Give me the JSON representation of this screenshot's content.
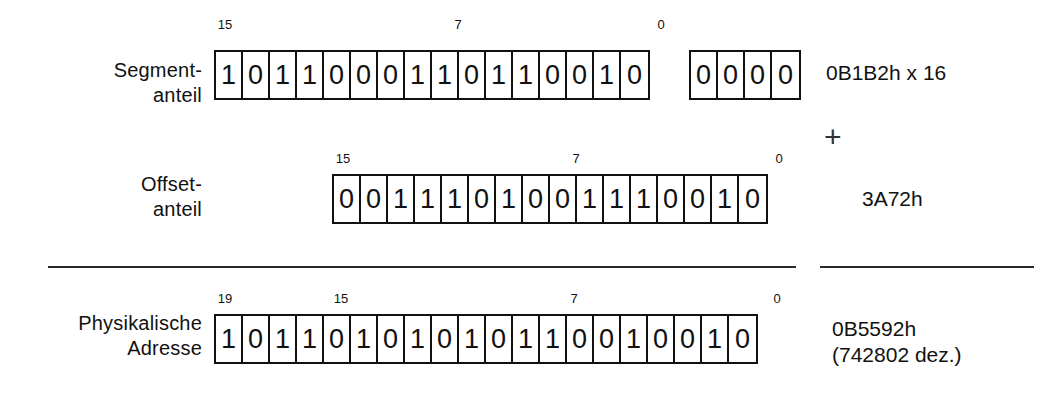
{
  "figure": {
    "rows": [
      {
        "id": "segment",
        "label": "Segment-\nanteil",
        "bits_main": [
          "1",
          "0",
          "1",
          "1",
          "0",
          "0",
          "0",
          "1",
          "1",
          "0",
          "1",
          "1",
          "0",
          "0",
          "1",
          "0"
        ],
        "bits_extra": [
          "0",
          "0",
          "0",
          "0"
        ],
        "indices": [
          {
            "text": "15",
            "bit": 15
          },
          {
            "text": "7",
            "bit": 7
          },
          {
            "text": "0",
            "bit": 0
          }
        ],
        "value": "0B1B2h x 16"
      },
      {
        "id": "offset",
        "label": "Offset-\nanteil",
        "bits_main": [
          "0",
          "0",
          "1",
          "1",
          "1",
          "0",
          "1",
          "0",
          "0",
          "1",
          "1",
          "1",
          "0",
          "0",
          "1",
          "0"
        ],
        "bits_extra": [],
        "indices": [
          {
            "text": "15",
            "bit": 15
          },
          {
            "text": "7",
            "bit": 7
          },
          {
            "text": "0",
            "bit": 0
          }
        ],
        "value": "3A72h"
      },
      {
        "id": "physical",
        "label": "Physikalische\nAdresse",
        "bits_main": [
          "1",
          "0",
          "1",
          "1",
          "0",
          "1",
          "0",
          "1",
          "0",
          "1",
          "0",
          "1",
          "1",
          "0",
          "0",
          "1",
          "0",
          "0",
          "1",
          "0"
        ],
        "bits_extra": [],
        "indices": [
          {
            "text": "19",
            "bit": 19
          },
          {
            "text": "15",
            "bit": 15
          },
          {
            "text": "7",
            "bit": 7
          },
          {
            "text": "0",
            "bit": 0
          }
        ],
        "value": "0B5592h\n(742802 dez.)"
      }
    ],
    "operator": "+",
    "colors": {
      "ink": "#111111",
      "rule": "#2a2a2a",
      "paper": "#ffffff"
    }
  }
}
